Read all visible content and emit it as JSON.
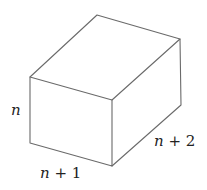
{
  "diagram": {
    "type": "rectangular-prism",
    "stroke_color": "#6a6a6a",
    "vertices": {
      "top_back": [
        97,
        15
      ],
      "right_back_top": [
        180,
        39
      ],
      "left_front_top": [
        30,
        77
      ],
      "front_right_top": [
        112,
        100
      ],
      "bottom_left": [
        30,
        143
      ],
      "bottom_front": [
        112,
        166
      ],
      "bottom_right": [
        181,
        105
      ]
    },
    "labels": {
      "height": {
        "var": "n",
        "op": "",
        "num": ""
      },
      "width": {
        "var": "n",
        "op": "+",
        "num": "1"
      },
      "depth": {
        "var": "n",
        "op": "+",
        "num": "2"
      }
    }
  }
}
